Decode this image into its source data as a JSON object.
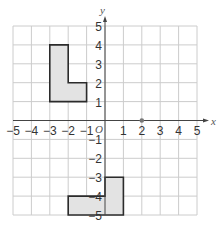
{
  "diagram": {
    "type": "coordinate-grid",
    "x_axis_label": "x",
    "y_axis_label": "y",
    "origin_label": "O",
    "x_range": [
      -5,
      5
    ],
    "y_range": [
      -5,
      5
    ],
    "x_ticks": [
      "-5",
      "-4",
      "-3",
      "-2",
      "-1",
      "1",
      "2",
      "3",
      "4",
      "5"
    ],
    "y_ticks": [
      "5",
      "4",
      "3",
      "2",
      "1",
      "-1",
      "-2",
      "-3",
      "-4",
      "-5"
    ],
    "shapes": [
      {
        "name": "upper-l-shape",
        "vertices": [
          [
            -3,
            4
          ],
          [
            -2,
            4
          ],
          [
            -2,
            2
          ],
          [
            -1,
            2
          ],
          [
            -1,
            1
          ],
          [
            -3,
            1
          ]
        ],
        "fill": "#e3e3e3",
        "stroke": "#2b2b2b"
      },
      {
        "name": "lower-l-shape",
        "vertices": [
          [
            -2,
            -4
          ],
          [
            0,
            -4
          ],
          [
            0,
            -3
          ],
          [
            1,
            -3
          ],
          [
            1,
            -5
          ],
          [
            -2,
            -5
          ]
        ],
        "fill": "#e3e3e3",
        "stroke": "#2b2b2b"
      }
    ],
    "points": [
      {
        "name": "center-point",
        "x": 2,
        "y": 0,
        "color": "#777777"
      }
    ],
    "colors": {
      "grid": "#cccccc",
      "axis": "#444444",
      "label": "#333333"
    }
  }
}
